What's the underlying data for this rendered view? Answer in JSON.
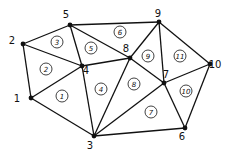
{
  "diagram": {
    "type": "triangular finite element mesh",
    "nodes": [
      {
        "id": "1",
        "x": 31,
        "y": 98,
        "lx": 17,
        "ly": 102
      },
      {
        "id": "2",
        "x": 23,
        "y": 44,
        "lx": 12,
        "ly": 44
      },
      {
        "id": "3",
        "x": 94,
        "y": 136,
        "lx": 90,
        "ly": 149
      },
      {
        "id": "4",
        "x": 82,
        "y": 66,
        "lx": 86,
        "ly": 74
      },
      {
        "id": "5",
        "x": 70,
        "y": 25,
        "lx": 66,
        "ly": 18
      },
      {
        "id": "6",
        "x": 185,
        "y": 128,
        "lx": 182,
        "ly": 140
      },
      {
        "id": "7",
        "x": 164,
        "y": 83,
        "lx": 166,
        "ly": 78
      },
      {
        "id": "8",
        "x": 130,
        "y": 58,
        "lx": 126,
        "ly": 52
      },
      {
        "id": "9",
        "x": 159,
        "y": 22,
        "lx": 158,
        "ly": 17
      },
      {
        "id": "10",
        "x": 210,
        "y": 64,
        "lx": 215,
        "ly": 68
      }
    ],
    "edges": [
      [
        "1",
        "2"
      ],
      [
        "1",
        "4"
      ],
      [
        "1",
        "3"
      ],
      [
        "2",
        "5"
      ],
      [
        "2",
        "4"
      ],
      [
        "5",
        "4"
      ],
      [
        "5",
        "8"
      ],
      [
        "5",
        "9"
      ],
      [
        "4",
        "8"
      ],
      [
        "4",
        "3"
      ],
      [
        "3",
        "8"
      ],
      [
        "3",
        "7"
      ],
      [
        "3",
        "6"
      ],
      [
        "8",
        "9"
      ],
      [
        "8",
        "7"
      ],
      [
        "9",
        "7"
      ],
      [
        "9",
        "10"
      ],
      [
        "7",
        "10"
      ],
      [
        "7",
        "6"
      ],
      [
        "10",
        "6"
      ]
    ],
    "elements": [
      {
        "id": "1",
        "x": 62,
        "y": 96
      },
      {
        "id": "2",
        "x": 46,
        "y": 69
      },
      {
        "id": "3",
        "x": 57,
        "y": 42
      },
      {
        "id": "4",
        "x": 101,
        "y": 89
      },
      {
        "id": "5",
        "x": 91,
        "y": 48
      },
      {
        "id": "6",
        "x": 120,
        "y": 32
      },
      {
        "id": "7",
        "x": 151,
        "y": 112
      },
      {
        "id": "8",
        "x": 134,
        "y": 84
      },
      {
        "id": "9",
        "x": 148,
        "y": 56
      },
      {
        "id": "10",
        "x": 186,
        "y": 91
      },
      {
        "id": "11",
        "x": 180,
        "y": 56
      }
    ]
  }
}
